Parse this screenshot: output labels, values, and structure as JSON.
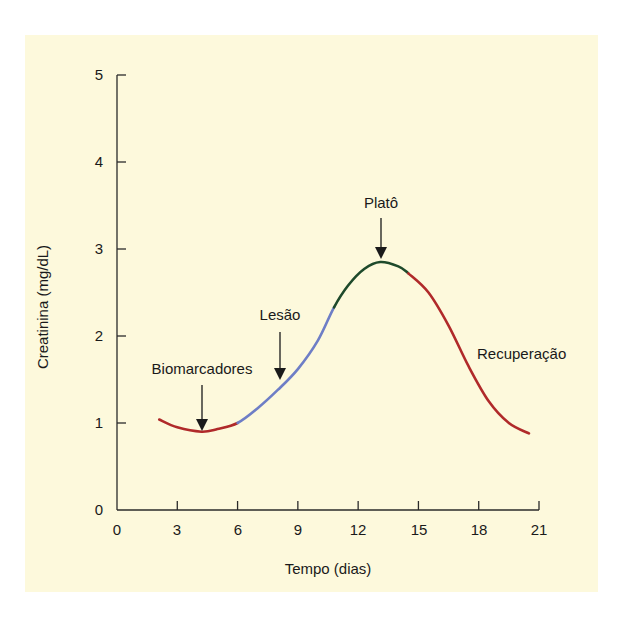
{
  "chart_data": {
    "type": "line",
    "title": "",
    "xlabel": "Tempo (dias)",
    "ylabel": "Creatinina (mg/dL)",
    "xlim": [
      0,
      21
    ],
    "ylim": [
      0,
      5
    ],
    "xticks": [
      0,
      3,
      6,
      9,
      12,
      15,
      18,
      21
    ],
    "yticks": [
      0,
      1,
      2,
      3,
      4,
      5
    ],
    "grid": false,
    "legend": null,
    "series": [
      {
        "name": "Creatinina",
        "segments": [
          {
            "phase": "Biomarcadores",
            "color": "#b02a2a",
            "x": [
              2.1,
              3,
              4.2,
              5,
              6
            ],
            "y": [
              1.04,
              0.95,
              0.9,
              0.93,
              1.0
            ]
          },
          {
            "phase": "Lesão",
            "color": "#6e7ec6",
            "x": [
              6,
              7,
              8,
              9,
              10,
              10.8
            ],
            "y": [
              1.0,
              1.17,
              1.38,
              1.62,
              1.95,
              2.33
            ]
          },
          {
            "phase": "Platô",
            "color": "#1e4a2b",
            "x": [
              10.8,
              11.5,
              12.3,
              13.1,
              14,
              14.5
            ],
            "y": [
              2.33,
              2.58,
              2.77,
              2.85,
              2.8,
              2.72
            ]
          },
          {
            "phase": "Recuperação",
            "color": "#b02a2a",
            "x": [
              14.5,
              15.5,
              16.5,
              17.5,
              18.5,
              19.5,
              20.5
            ],
            "y": [
              2.72,
              2.5,
              2.12,
              1.65,
              1.25,
              1.0,
              0.88
            ]
          }
        ]
      }
    ],
    "annotations": [
      {
        "text": "Biomarcadores",
        "arrow_to": [
          4.2,
          0.9
        ]
      },
      {
        "text": "Lesão",
        "arrow_to": [
          8.1,
          1.4
        ]
      },
      {
        "text": "Platô",
        "arrow_to": [
          13.1,
          2.85
        ]
      },
      {
        "text": "Recuperação",
        "arrow_to": null
      }
    ]
  },
  "labels": {
    "x_axis_title": "Tempo (dias)",
    "y_axis_title": "Creatinina (mg/dL)",
    "x_ticks": [
      "0",
      "3",
      "6",
      "9",
      "12",
      "15",
      "18",
      "21"
    ],
    "y_ticks": [
      "0",
      "1",
      "2",
      "3",
      "4",
      "5"
    ],
    "annot_biomarcadores": "Biomarcadores",
    "annot_lesao": "Lesão",
    "annot_plato": "Platô",
    "annot_recuperacao": "Recuperação"
  },
  "colors": {
    "panel_bg": "#fdf9dc",
    "axis": "#2a2a2a",
    "red": "#b02a2a",
    "blue": "#6e7ec6",
    "green": "#1e4a2b"
  }
}
